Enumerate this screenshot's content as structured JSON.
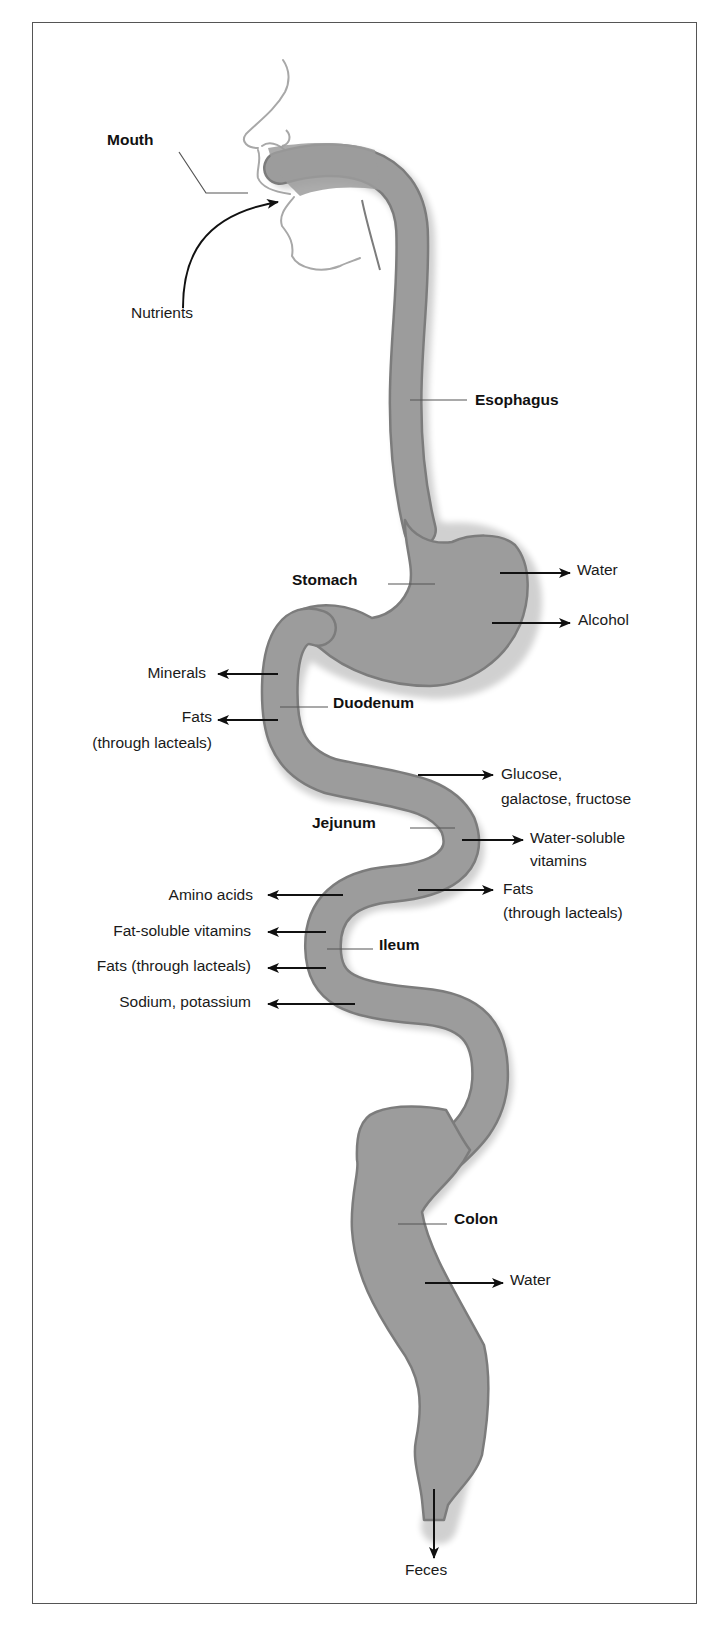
{
  "diagram": {
    "structures": {
      "mouth": "Mouth",
      "esophagus": "Esophagus",
      "stomach": "Stomach",
      "duodenum": "Duodenum",
      "jejunum": "Jejunum",
      "ileum": "Ileum",
      "colon": "Colon"
    },
    "inputs": {
      "nutrients": "Nutrients"
    },
    "outputs": {
      "feces": "Feces"
    },
    "absorption": {
      "stomach": [
        {
          "label": "Water",
          "direction": "right"
        },
        {
          "label": "Alcohol",
          "direction": "right"
        }
      ],
      "duodenum": [
        {
          "label": "Minerals",
          "direction": "left"
        },
        {
          "label_line1": "Fats",
          "label_line2": "(through lacteals)",
          "direction": "left"
        }
      ],
      "jejunum": [
        {
          "label_line1": "Glucose,",
          "label_line2": "galactose, fructose",
          "direction": "right"
        },
        {
          "label_line1": "Water-soluble",
          "label_line2": "vitamins",
          "direction": "right"
        },
        {
          "label_line1": "Fats",
          "label_line2": "(through lacteals)",
          "direction": "right"
        }
      ],
      "ileum": [
        {
          "label": "Amino acids",
          "direction": "left"
        },
        {
          "label": "Fat-soluble vitamins",
          "direction": "left"
        },
        {
          "label": "Fats (through lacteals)",
          "direction": "left"
        },
        {
          "label": "Sodium, potassium",
          "direction": "left"
        }
      ],
      "colon": [
        {
          "label": "Water",
          "direction": "right"
        }
      ]
    },
    "colors": {
      "tube_fill": "#9a9a9a",
      "tube_edge": "#7c7c7c",
      "face_outline": "#a8a8a8",
      "arrow": "#111111",
      "leader": "#555555",
      "frame": "#555555"
    }
  }
}
